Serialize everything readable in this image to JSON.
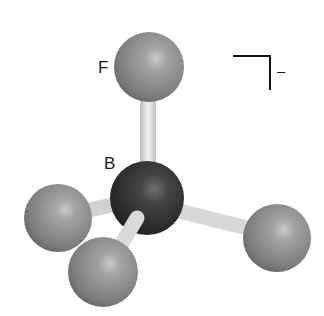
{
  "diagram": {
    "labels": {
      "fluorine": "F",
      "boron": "B",
      "charge": "–"
    },
    "atoms": [
      {
        "element": "F",
        "position": "top"
      },
      {
        "element": "B",
        "position": "center"
      },
      {
        "element": "F",
        "position": "left"
      },
      {
        "element": "F",
        "position": "bottom"
      },
      {
        "element": "F",
        "position": "right"
      }
    ],
    "colors": {
      "fluorine": "#8a8a8a",
      "boron": "#3a3a3a",
      "bond": "#e2e2e2",
      "bracket": "#111111"
    }
  }
}
